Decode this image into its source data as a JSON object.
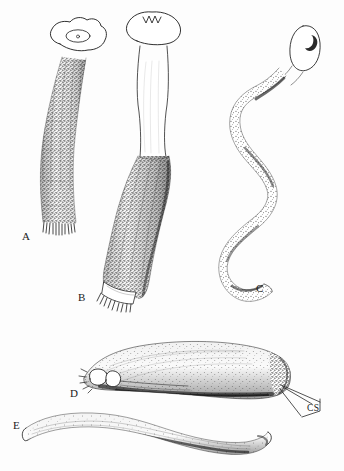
{
  "figure": {
    "type": "scientific-illustration-plate",
    "medium": "pen-and-ink stipple drawing",
    "background_color": "#fdfdfd",
    "ink_color": "#1a1a1a",
    "panel_count": 5
  },
  "labels": {
    "a": "A",
    "b": "B",
    "c": "C",
    "d": "D",
    "e": "E",
    "cs": "CS"
  },
  "panels": [
    {
      "id": "A",
      "label": "A",
      "label_x": 22,
      "label_y": 231,
      "description": "elongate club-shaped organ, gently sigmoid, densely stippled, with lobed apical cap bearing inner oval aperture and a fringed basal margin",
      "apex": "lobed cap with inner oval",
      "base": "fringed / bristled rim"
    },
    {
      "id": "B",
      "label": "B",
      "label_x": 78,
      "label_y": 292,
      "description": "organ with smooth pale neck, bulbous notched apical cap, and swollen densely stippled basal half ending in a pale collar with fringe",
      "apex": "bulbous cap with three small apical notches",
      "base": "pale collar with fringed rim"
    },
    {
      "id": "C",
      "label": "C",
      "label_x": 256,
      "label_y": 283,
      "description": "long serpentine flagellate organ in a double S-curve, finely stippled, tipped by an elongate oval head bearing a crescentic mark",
      "apex": "elongate oval head with crescent marking",
      "base": "blunt rounded tip"
    },
    {
      "id": "D",
      "label": "D",
      "label_x": 70,
      "label_y": 388,
      "description": "lateral view of a stout curved sac, heavily stippled dorsally, with a figure-eight double loop at the left end and spinose right end from which leader lines point to CS",
      "apex": "figure-eight double loop (left)",
      "base": "spinose swollen end (right)"
    },
    {
      "id": "E",
      "label": "E",
      "label_x": 13,
      "label_y": 420,
      "description": "slender elongate wavy tube, lightly stippled, open and flared at the left end, blunt and darker at the right end",
      "apex": "open flared left end",
      "base": "blunt dark right end"
    }
  ],
  "annotations": [
    {
      "id": "CS",
      "text": "CS",
      "label_x": 307,
      "label_y": 404,
      "points_to": "D",
      "leader_style": "bracketed converging leader lines",
      "description": "three fine leader lines from the spinose right end of panel D converging to a bracket beside the CS label"
    }
  ]
}
